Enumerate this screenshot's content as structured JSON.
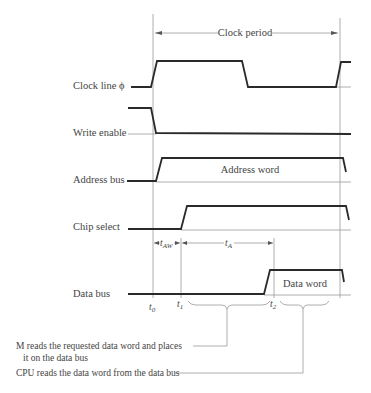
{
  "diagram": {
    "type": "timing-diagram",
    "period_label": "Clock period",
    "signals": [
      {
        "id": "clock",
        "label": "Clock line ϕ"
      },
      {
        "id": "write-enable",
        "label": "Write enable"
      },
      {
        "id": "address-bus",
        "label": "Address bus",
        "value_label": "Address word"
      },
      {
        "id": "chip-select",
        "label": "Chip select"
      },
      {
        "id": "data-bus",
        "label": "Data bus",
        "value_label": "Data word"
      }
    ],
    "intervals": [
      {
        "label": "t",
        "sub": "AW"
      },
      {
        "label": "t",
        "sub": "A"
      }
    ],
    "time_marks": [
      {
        "label": "t",
        "sub": "0"
      },
      {
        "label": "t",
        "sub": "1"
      },
      {
        "label": "t",
        "sub": "2"
      }
    ],
    "annotations": [
      {
        "line1": "M reads the requested data word and places",
        "line2": "it on the data bus"
      },
      {
        "line1": "CPU reads the data word from the data bus"
      }
    ]
  }
}
